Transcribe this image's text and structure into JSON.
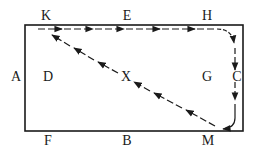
{
  "diagram": {
    "type": "rectangle-path-diagram",
    "colors": {
      "ink": "#1a1a1a",
      "background": "#ffffff"
    },
    "rectangle": {
      "x": 25,
      "y": 25,
      "width": 218,
      "height": 106
    },
    "labels": {
      "K": "K",
      "E": "E",
      "H": "H",
      "A": "A",
      "D": "D",
      "X": "X",
      "G": "G",
      "C": "C",
      "F": "F",
      "B": "B",
      "M": "M"
    },
    "paths": [
      {
        "name": "top-path",
        "from": "K",
        "to": "H",
        "via": "E",
        "style": "dashed",
        "arrows": "rightward"
      },
      {
        "name": "right-path",
        "from": "H",
        "to": "M",
        "via": "C",
        "style": "dashed-curved",
        "arrows": "downward"
      },
      {
        "name": "diagonal-path",
        "from": "M",
        "to": "K",
        "via": "X",
        "style": "dashed",
        "arrows": "up-left"
      }
    ]
  }
}
